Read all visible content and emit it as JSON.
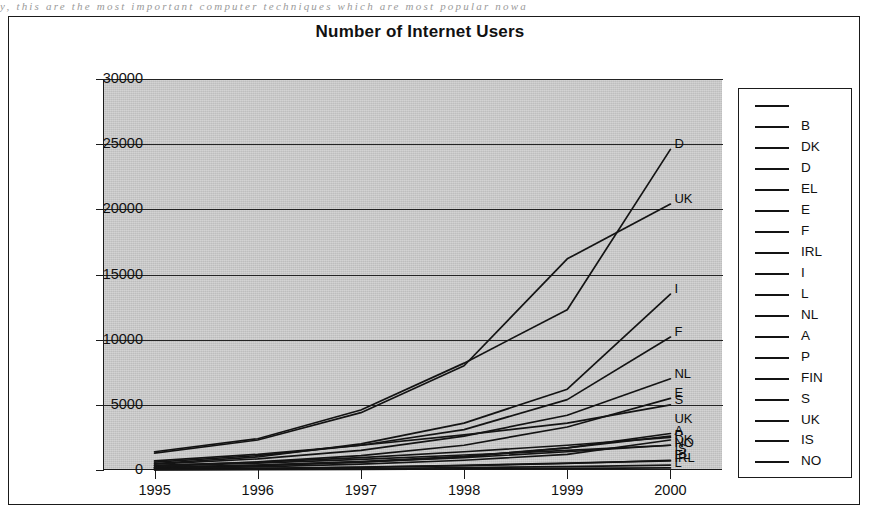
{
  "page": {
    "scan_text": "y, this are the most important computer techniques which are most popular nowa"
  },
  "chart_data": {
    "type": "line",
    "title": "Number of Internet Users",
    "xlabel": "",
    "ylabel": "",
    "grid": true,
    "legend_position": "right",
    "x": [
      1995,
      1996,
      1997,
      1998,
      1999,
      2000
    ],
    "xtick_labels": [
      "1995",
      "1996",
      "1997",
      "1998",
      "1999",
      "2000"
    ],
    "ytick_labels": [
      "0",
      "5000",
      "10000",
      "15000",
      "20000",
      "25000",
      "30000"
    ],
    "ytick_values": [
      0,
      5000,
      10000,
      15000,
      20000,
      25000,
      30000
    ],
    "ylim": [
      0,
      30000
    ],
    "series": [
      {
        "name": "B",
        "label": "B",
        "values": [
          180,
          330,
          600,
          1000,
          1700,
          2800
        ]
      },
      {
        "name": "DK",
        "label": "DK",
        "values": [
          200,
          360,
          620,
          950,
          1400,
          1900
        ]
      },
      {
        "name": "D",
        "label": "D",
        "values": [
          1400,
          2400,
          4600,
          8200,
          12300,
          24600
        ]
      },
      {
        "name": "EL",
        "label": "EL",
        "values": [
          60,
          110,
          200,
          330,
          500,
          750
        ]
      },
      {
        "name": "E",
        "label": "E",
        "values": [
          320,
          620,
          1100,
          1900,
          3300,
          5500
        ]
      },
      {
        "name": "F",
        "label": "F",
        "values": [
          600,
          1100,
          1900,
          3100,
          5400,
          10200
        ]
      },
      {
        "name": "IRL",
        "label": "IRL",
        "values": [
          70,
          130,
          230,
          360,
          520,
          700
        ]
      },
      {
        "name": "I",
        "label": "I",
        "values": [
          500,
          1000,
          2000,
          3600,
          6200,
          13500
        ]
      },
      {
        "name": "L",
        "label": "L",
        "values": [
          15,
          30,
          55,
          85,
          120,
          160
        ]
      },
      {
        "name": "NL",
        "label": "NL",
        "values": [
          450,
          850,
          1500,
          2600,
          4200,
          7000
        ]
      },
      {
        "name": "A",
        "label": "A",
        "values": [
          200,
          370,
          650,
          1050,
          1700,
          2600
        ]
      },
      {
        "name": "P",
        "label": "P",
        "values": [
          120,
          240,
          450,
          750,
          1200,
          2300
        ]
      },
      {
        "name": "FIN",
        "label": "FIN",
        "values": [
          350,
          600,
          950,
          1400,
          1900,
          2500
        ]
      },
      {
        "name": "S",
        "label": "S",
        "values": [
          700,
          1200,
          1900,
          2700,
          3600,
          5000
        ]
      },
      {
        "name": "UK",
        "label": "UK",
        "values": [
          1300,
          2300,
          4400,
          8000,
          16200,
          20400
        ]
      },
      {
        "name": "IS",
        "label": "IS",
        "values": [
          30,
          60,
          110,
          180,
          260,
          380
        ]
      },
      {
        "name": "NO",
        "label": "NO",
        "values": [
          300,
          520,
          820,
          1150,
          1500,
          1900
        ]
      }
    ],
    "series_end_tags": [
      {
        "label": "D",
        "value": 24600
      },
      {
        "label": "UK",
        "value": 20400
      },
      {
        "label": "I",
        "value": 13500
      },
      {
        "label": "F",
        "value": 10200
      },
      {
        "label": "NL",
        "value": 7000
      },
      {
        "label": "E",
        "value": 5500
      },
      {
        "label": "S",
        "value": 5000
      },
      {
        "label": "UK",
        "value": 3500
      },
      {
        "label": "A",
        "value": 2600
      },
      {
        "label": "P",
        "value": 2300
      },
      {
        "label": "DK",
        "value": 1900
      },
      {
        "label": "NO",
        "value": 1700
      },
      {
        "label": "IS",
        "value": 1200
      },
      {
        "label": "EL",
        "value": 750
      },
      {
        "label": "IRL",
        "value": 560
      },
      {
        "label": "L",
        "value": 160
      }
    ]
  },
  "legend": {
    "entries": [
      {
        "label": ""
      },
      {
        "label": "B"
      },
      {
        "label": "DK"
      },
      {
        "label": "D"
      },
      {
        "label": "EL"
      },
      {
        "label": "E"
      },
      {
        "label": "F"
      },
      {
        "label": "IRL"
      },
      {
        "label": "I"
      },
      {
        "label": "L"
      },
      {
        "label": "NL"
      },
      {
        "label": "A"
      },
      {
        "label": "P"
      },
      {
        "label": "FIN"
      },
      {
        "label": "S"
      },
      {
        "label": "UK"
      },
      {
        "label": "IS"
      },
      {
        "label": "NO"
      }
    ]
  },
  "colors": {
    "plot_background": "#c6c6c6",
    "line": "#141414",
    "frame": "#1a1a1a",
    "text": "#111111"
  }
}
